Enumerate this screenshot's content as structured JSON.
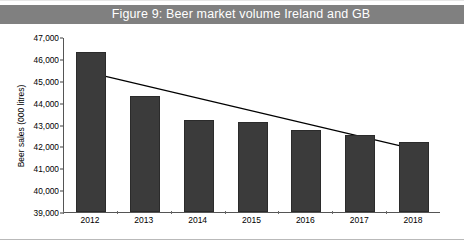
{
  "title": {
    "text": "Figure 9: Beer market volume Ireland and GB",
    "background": "#808080",
    "color": "#ffffff"
  },
  "chart_data": {
    "type": "bar",
    "title": "Figure 9: Beer market volume Ireland and GB",
    "xlabel": "",
    "ylabel": "Beer sales (000 litres)",
    "categories": [
      "2012",
      "2013",
      "2014",
      "2015",
      "2016",
      "2017",
      "2018"
    ],
    "values": [
      46300,
      44300,
      43200,
      43100,
      42750,
      42500,
      42200
    ],
    "ylim": [
      39000,
      47000
    ],
    "ytick_step": 1000,
    "ytick_labels": [
      "47,000",
      "46,000",
      "45,000",
      "44,000",
      "43,000",
      "42,000",
      "41,000",
      "40,000",
      "39,000"
    ],
    "ytick_values": [
      47000,
      46000,
      45000,
      44000,
      43000,
      42000,
      41000,
      40000,
      39000
    ],
    "grid": false,
    "legend": "none",
    "bar_color": "#3b3b3b",
    "series": [
      {
        "name": "Beer sales (000 litres)",
        "values": [
          46300,
          44300,
          43200,
          43100,
          42750,
          42500,
          42200
        ]
      },
      {
        "name": "Linear trend",
        "type": "line",
        "color": "#000000",
        "start_value": 45400,
        "end_value": 41900
      }
    ],
    "annotations": []
  }
}
